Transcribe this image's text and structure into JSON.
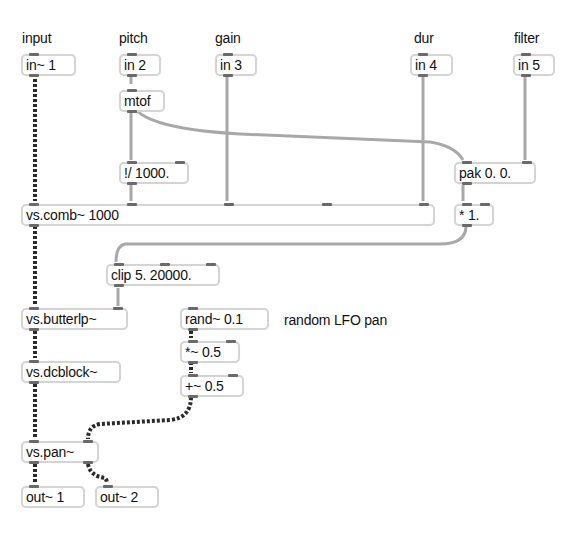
{
  "labels": {
    "input": "input",
    "pitch": "pitch",
    "gain": "gain",
    "dur": "dur",
    "filter": "filter",
    "comment_lfo": "random LFO pan"
  },
  "objects": {
    "in1": "in~ 1",
    "in2": "in 2",
    "in3": "in 3",
    "in4": "in 4",
    "in5": "in 5",
    "mtof": "mtof",
    "rdiv": "!/ 1000.",
    "pak": "pak 0. 0.",
    "comb": "vs.comb~ 1000",
    "mul": "* 1.",
    "clip": "clip 5. 20000.",
    "butterlp": "vs.butterlp~",
    "rand": "rand~ 0.1",
    "mulsig": "*~ 0.5",
    "dcblock": "vs.dcblock~",
    "addsig": "+~ 0.5",
    "pan": "vs.pan~",
    "out1": "out~ 1",
    "out2": "out~ 2"
  },
  "colors": {
    "signal_wire": "#2a2a2a",
    "control_wire": "#a8a8a8",
    "box_border": "#d4d4d4",
    "port": "#6a6a6a"
  }
}
